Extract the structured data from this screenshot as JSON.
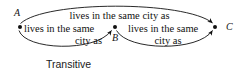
{
  "figure": {
    "caption": "Transitive",
    "nodes": [
      {
        "id": "A",
        "label": "A",
        "x": 20,
        "y": 27
      },
      {
        "id": "B",
        "label": "B",
        "x": 115,
        "y": 27
      },
      {
        "id": "C",
        "label": "C",
        "x": 215,
        "y": 27
      }
    ],
    "edges": [
      {
        "id": "a-to-c",
        "from": "A",
        "to": "C",
        "label": "lives in the same city as",
        "position": "top"
      },
      {
        "id": "a-to-b",
        "from": "A",
        "to": "B",
        "label_line1": "lives in the same",
        "label_line2": "city as",
        "position": "bottom-left"
      },
      {
        "id": "b-to-c",
        "from": "B",
        "to": "C",
        "label_line1": "lives in the same",
        "label_line2": "city as",
        "position": "bottom-right"
      }
    ],
    "colors": {
      "ink": "#111111",
      "background": "#ffffff"
    }
  }
}
